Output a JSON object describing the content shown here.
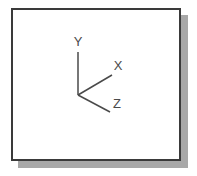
{
  "page": {
    "background_color": "#ffffff",
    "width": 197,
    "height": 176
  },
  "panel": {
    "name": "coordinate-axes-panel",
    "background_color": "#ffffff",
    "border_color": "#3a3a3a",
    "shadow_color": "#a8a8a8"
  },
  "diagram": {
    "title": "",
    "line_color": "#4a4a4a",
    "origin": {
      "x": 65,
      "y": 85
    },
    "axes": [
      {
        "id": "y-axis",
        "label": "Y",
        "from": {
          "x": 65,
          "y": 85
        },
        "to": {
          "x": 65,
          "y": 42
        },
        "label_pos": {
          "x": 65,
          "y": 36
        }
      },
      {
        "id": "x-axis",
        "label": "X",
        "from": {
          "x": 65,
          "y": 85
        },
        "to": {
          "x": 99,
          "y": 65
        },
        "label_pos": {
          "x": 105,
          "y": 60
        }
      },
      {
        "id": "z-axis",
        "label": "Z",
        "from": {
          "x": 65,
          "y": 85
        },
        "to": {
          "x": 97,
          "y": 102
        },
        "label_pos": {
          "x": 104,
          "y": 98
        }
      }
    ]
  }
}
